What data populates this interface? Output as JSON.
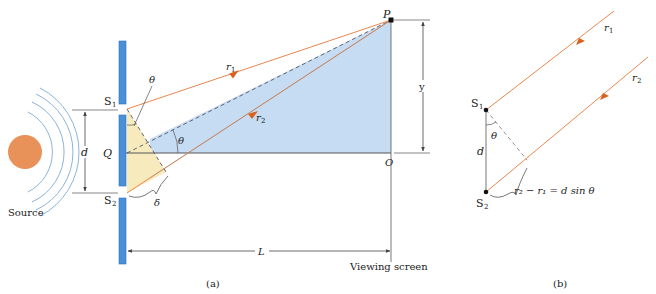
{
  "colors": {
    "barrier": "#4a90d9",
    "barrier_stroke": "#2c6fb5",
    "blue_fill": "#c5dcf3",
    "yellow_fill": "#f7ebbd",
    "ray": "#e8874f",
    "arrow": "#d9611f",
    "line": "#555555",
    "source_fill": "#e8925a",
    "wave": "#8cb4d8"
  },
  "part_a": {
    "caption": "(a)",
    "source_label": "Source",
    "slit1_label": "S",
    "slit1_sub": "1",
    "slit2_label": "S",
    "slit2_sub": "2",
    "center_label": "Q",
    "separation_label": "d",
    "theta_label": "θ",
    "theta_label_2": "θ",
    "delta_label": "δ",
    "ray1_label": "r",
    "ray1_sub": "1",
    "ray2_label": "r",
    "ray2_sub": "2",
    "point_p_label": "P",
    "point_o_label": "O",
    "height_label": "y",
    "distance_label": "L",
    "screen_label": "Viewing screen"
  },
  "part_b": {
    "caption": "(b)",
    "slit1_label": "S",
    "slit1_sub": "1",
    "slit2_label": "S",
    "slit2_sub": "2",
    "separation_label": "d",
    "theta_label": "θ",
    "ray1_label": "r",
    "ray1_sub": "1",
    "ray2_label": "r",
    "ray2_sub": "2",
    "path_difference_label": "r₂ − r₁ = d sin θ"
  }
}
